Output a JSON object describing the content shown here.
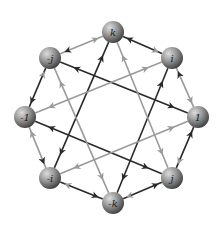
{
  "colors": {
    "dark_edge": "#2a2a2a",
    "light_edge": "#9a9a9a",
    "node_fill_light": "#bdbdbd",
    "node_fill_dark": "#4a4a4a",
    "background": "#ffffff"
  },
  "nodes": [
    {
      "id": "k",
      "label": "k",
      "x": 113,
      "y": 32
    },
    {
      "id": "i",
      "label": "i",
      "x": 172,
      "y": 58
    },
    {
      "id": "1",
      "label": "1",
      "x": 198,
      "y": 117
    },
    {
      "id": "j",
      "label": "j",
      "x": 172,
      "y": 178
    },
    {
      "id": "-k",
      "label": "-k",
      "x": 113,
      "y": 203
    },
    {
      "id": "-i",
      "label": "-i",
      "x": 50,
      "y": 178
    },
    {
      "id": "-1",
      "label": "-1",
      "x": 25,
      "y": 117
    },
    {
      "id": "-j",
      "label": "-j",
      "x": 50,
      "y": 58
    }
  ],
  "edges": [
    {
      "from": "-j",
      "to": "k",
      "color": "light"
    },
    {
      "from": "k",
      "to": "-j",
      "color": "dark"
    },
    {
      "from": "i",
      "to": "k",
      "color": "dark"
    },
    {
      "from": "k",
      "to": "i",
      "color": "light"
    },
    {
      "from": "i",
      "to": "1",
      "color": "light"
    },
    {
      "from": "1",
      "to": "i",
      "color": "dark"
    },
    {
      "from": "j",
      "to": "1",
      "color": "dark"
    },
    {
      "from": "1",
      "to": "j",
      "color": "light"
    },
    {
      "from": "-k",
      "to": "j",
      "color": "dark"
    },
    {
      "from": "j",
      "to": "-k",
      "color": "light"
    },
    {
      "from": "-i",
      "to": "-k",
      "color": "dark"
    },
    {
      "from": "-k",
      "to": "-i",
      "color": "light"
    },
    {
      "from": "-i",
      "to": "-1",
      "color": "light"
    },
    {
      "from": "-1",
      "to": "-i",
      "color": "dark"
    },
    {
      "from": "-j",
      "to": "-1",
      "color": "dark"
    },
    {
      "from": "-1",
      "to": "-j",
      "color": "light"
    },
    {
      "from": "1",
      "to": "-j",
      "color": "dark",
      "chord": true
    },
    {
      "from": "-j",
      "to": "1",
      "color": "dark",
      "chord": true
    },
    {
      "from": "-1",
      "to": "j",
      "color": "dark",
      "chord": true
    },
    {
      "from": "j",
      "to": "-1",
      "color": "dark",
      "chord": true
    },
    {
      "from": "k",
      "to": "-i",
      "color": "dark",
      "chord": true
    },
    {
      "from": "-i",
      "to": "k",
      "color": "dark",
      "chord": true
    },
    {
      "from": "-k",
      "to": "i",
      "color": "dark",
      "chord": true
    },
    {
      "from": "i",
      "to": "-k",
      "color": "dark",
      "chord": true
    },
    {
      "from": "i",
      "to": "-1",
      "color": "light",
      "chord": true
    },
    {
      "from": "-1",
      "to": "i",
      "color": "light",
      "chord": true
    },
    {
      "from": "-i",
      "to": "1",
      "color": "light",
      "chord": true
    },
    {
      "from": "1",
      "to": "-i",
      "color": "light",
      "chord": true
    },
    {
      "from": "-j",
      "to": "-k",
      "color": "light",
      "chord": true
    },
    {
      "from": "-k",
      "to": "-j",
      "color": "light",
      "chord": true
    },
    {
      "from": "j",
      "to": "k",
      "color": "light",
      "chord": true
    },
    {
      "from": "k",
      "to": "j",
      "color": "light",
      "chord": true
    }
  ]
}
